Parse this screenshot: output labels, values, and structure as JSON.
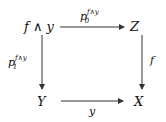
{
  "diagram": {
    "type": "commutative-square",
    "nodes": {
      "top_left": "f ∧ y",
      "top_right": "Z",
      "bottom_left": "Y",
      "bottom_right": "X"
    },
    "arrows": {
      "top": {
        "from": "f ∧ y",
        "to": "Z",
        "base": "p",
        "sub": "0",
        "sup": "f∧y"
      },
      "left": {
        "from": "f ∧ y",
        "to": "Y",
        "base": "p",
        "sub": "1",
        "sup": "f∧y"
      },
      "right": {
        "from": "Z",
        "to": "X",
        "label": "f"
      },
      "bottom": {
        "from": "Y",
        "to": "X",
        "label": "y"
      }
    },
    "stroke_color": "#333333"
  }
}
